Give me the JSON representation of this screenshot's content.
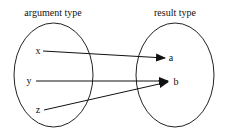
{
  "diagram": {
    "domain": {
      "title": "argument type",
      "elements": [
        "x",
        "y",
        "z"
      ]
    },
    "codomain": {
      "title": "result type",
      "elements": [
        "a",
        "b"
      ]
    },
    "mappings": [
      {
        "from": "x",
        "to": "a"
      },
      {
        "from": "y",
        "to": "b"
      },
      {
        "from": "z",
        "to": "b"
      }
    ]
  }
}
